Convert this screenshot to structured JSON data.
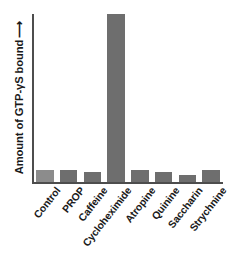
{
  "chart_data": {
    "type": "bar",
    "title": "",
    "subtitle": "",
    "xlabel": "",
    "ylabel": "Amount of GTP-γS bound",
    "ylabel_arrow": "⟶",
    "categories": [
      "Control",
      "PROP",
      "Caffeine",
      "Cycloheximide",
      "Atropine",
      "Quinine",
      "Saccharin",
      "Strychnine"
    ],
    "values": [
      7,
      7,
      6,
      100,
      7,
      6,
      4,
      7
    ],
    "ylim": [
      0,
      100
    ],
    "grid": false,
    "legend": null,
    "axis_ticks": false,
    "series": [
      {
        "name": "GTP-γS bound",
        "values": [
          7,
          7,
          6,
          100,
          7,
          6,
          4,
          7
        ]
      }
    ],
    "bar_colors": [
      "#8c8c8c",
      "#6e6e6e",
      "#6e6e6e",
      "#6e6e6e",
      "#6e6e6e",
      "#6e6e6e",
      "#6e6e6e",
      "#6e6e6e"
    ],
    "colors": {
      "bar_default": "#6e6e6e",
      "bar_control": "#8c8c8c",
      "axis": "#4d4d4d",
      "text": "#1a1a1a",
      "background": "#ffffff"
    }
  }
}
